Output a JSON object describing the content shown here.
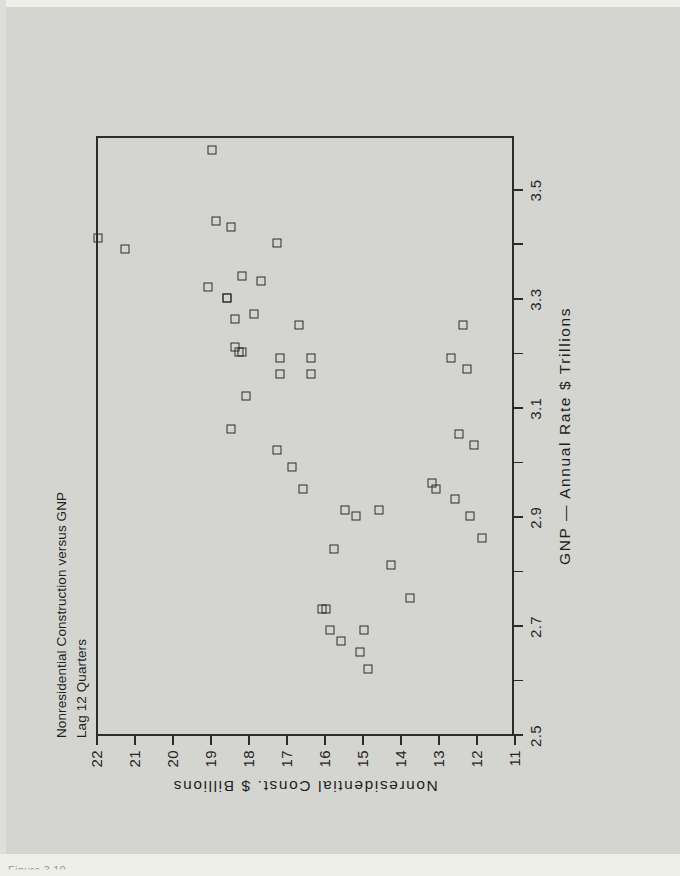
{
  "page": {
    "background_color": "#d4d5d0",
    "ink_color": "#2b2b2b"
  },
  "caption": "Figure 3.10",
  "chart_data": {
    "type": "scatter",
    "title": "Nonresidential Construction versus GNP",
    "subtitle": "Lag 12 Quarters",
    "xlabel": "GNP — Annual Rate $ Trillions",
    "ylabel": "Nonresidential Const. $ Billions",
    "orientation": "rotated-90-ccw",
    "marker": "open-square",
    "grid": false,
    "legend": null,
    "xlim": [
      2.5,
      3.6
    ],
    "ylim": [
      11,
      22
    ],
    "xticks": [
      2.5,
      2.6,
      2.7,
      2.8,
      2.9,
      3.0,
      3.1,
      3.2,
      3.3,
      3.4,
      3.5
    ],
    "xticklabels": [
      "2.5",
      "",
      "2.7",
      "",
      "2.9",
      "",
      "3.1",
      "",
      "3.3",
      "",
      "3.5"
    ],
    "yticks": [
      11,
      12,
      13,
      14,
      15,
      16,
      17,
      18,
      19,
      20,
      21,
      22
    ],
    "yticklabels": [
      "11",
      "12",
      "13",
      "14",
      "15",
      "16",
      "17",
      "18",
      "19",
      "20",
      "21",
      "22"
    ],
    "series": [
      {
        "name": "Nonresidential Construction vs GNP",
        "points": [
          [
            3.41,
            22.0
          ],
          [
            3.39,
            21.3
          ],
          [
            3.57,
            19.0
          ],
          [
            3.32,
            19.1
          ],
          [
            3.44,
            18.9
          ],
          [
            3.3,
            18.6
          ],
          [
            3.3,
            18.6
          ],
          [
            3.43,
            18.5
          ],
          [
            3.26,
            18.4
          ],
          [
            3.21,
            18.4
          ],
          [
            3.2,
            18.3
          ],
          [
            3.2,
            18.2
          ],
          [
            3.34,
            18.2
          ],
          [
            3.12,
            18.1
          ],
          [
            3.06,
            18.5
          ],
          [
            3.27,
            17.9
          ],
          [
            3.33,
            17.7
          ],
          [
            3.4,
            17.3
          ],
          [
            3.19,
            17.2
          ],
          [
            3.16,
            17.2
          ],
          [
            3.02,
            17.3
          ],
          [
            3.25,
            16.7
          ],
          [
            2.99,
            16.9
          ],
          [
            2.95,
            16.6
          ],
          [
            3.19,
            16.4
          ],
          [
            3.16,
            16.4
          ],
          [
            2.73,
            16.1
          ],
          [
            2.73,
            16.0
          ],
          [
            2.69,
            15.9
          ],
          [
            2.84,
            15.8
          ],
          [
            2.91,
            15.5
          ],
          [
            2.67,
            15.6
          ],
          [
            2.9,
            15.2
          ],
          [
            2.65,
            15.1
          ],
          [
            2.69,
            15.0
          ],
          [
            2.62,
            14.9
          ],
          [
            2.91,
            14.6
          ],
          [
            2.81,
            14.3
          ],
          [
            2.75,
            13.8
          ],
          [
            2.96,
            13.2
          ],
          [
            2.95,
            13.1
          ],
          [
            3.19,
            12.7
          ],
          [
            2.93,
            12.6
          ],
          [
            3.05,
            12.5
          ],
          [
            3.25,
            12.4
          ],
          [
            3.17,
            12.3
          ],
          [
            2.9,
            12.2
          ],
          [
            3.03,
            12.1
          ],
          [
            2.86,
            11.9
          ]
        ]
      }
    ]
  }
}
